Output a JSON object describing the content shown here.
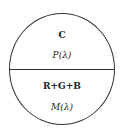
{
  "diagram": {
    "type": "split-circle",
    "top": {
      "title": "C",
      "function": "P(λ)"
    },
    "bottom": {
      "title": "R+G+B",
      "function": "M(λ)"
    }
  }
}
